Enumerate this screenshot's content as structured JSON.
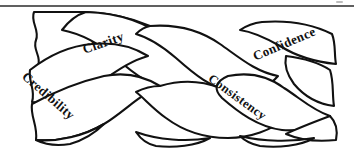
{
  "figure": {
    "type": "three-strand-braid-diagram",
    "title": "",
    "background_color": "#ffffff",
    "line_color": "#111111",
    "rule_color": "#2b2b2b",
    "width": 354,
    "height": 153
  },
  "divider": {
    "name": "top-horizontal-rule",
    "y": 6
  },
  "labels": [
    {
      "id": "credibility",
      "text": "Credibility",
      "rotation_deg": 41,
      "strand": "lower-left"
    },
    {
      "id": "clarity",
      "text": "Clarity",
      "rotation_deg": -19,
      "strand": "upper-left"
    },
    {
      "id": "consistency",
      "text": "Consistency",
      "rotation_deg": 36,
      "strand": "lower-right"
    },
    {
      "id": "confidence",
      "text": "Confidence",
      "rotation_deg": -23,
      "strand": "upper-right"
    }
  ]
}
